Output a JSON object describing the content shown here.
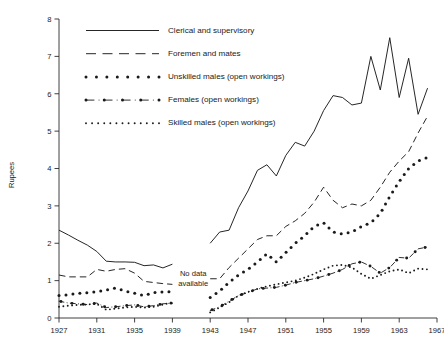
{
  "chart_data": {
    "type": "line",
    "title": "",
    "xlabel": "",
    "ylabel": "Rupees",
    "xlim": [
      1927,
      1967
    ],
    "ylim": [
      0,
      8
    ],
    "xticks": [
      1927,
      1931,
      1935,
      1939,
      1943,
      1947,
      1951,
      1955,
      1959,
      1963,
      1967
    ],
    "yticks": [
      0,
      1,
      2,
      3,
      4,
      5,
      6,
      7,
      8
    ],
    "grid": false,
    "legend_position": "top-center",
    "annotations": [
      {
        "text": "No data available",
        "x": 1941.2,
        "y": 1.12
      }
    ],
    "gap_note": "No data available between 1940 and 1942",
    "series": [
      {
        "name": "Clerical and supervisory",
        "style": "solid",
        "segments": [
          {
            "x": [
              1927,
              1928,
              1929,
              1930,
              1931,
              1932,
              1933,
              1934,
              1935,
              1936,
              1937,
              1938,
              1939
            ],
            "y": [
              2.35,
              2.22,
              2.08,
              1.95,
              1.78,
              1.52,
              1.5,
              1.5,
              1.49,
              1.4,
              1.42,
              1.34,
              1.44
            ]
          },
          {
            "x": [
              1943,
              1944,
              1945,
              1946,
              1947,
              1948,
              1949,
              1950,
              1951,
              1952,
              1953,
              1954,
              1955,
              1956,
              1957,
              1958,
              1959,
              1960,
              1961,
              1962,
              1963,
              1964,
              1965,
              1966
            ],
            "y": [
              2.0,
              2.3,
              2.35,
              2.95,
              3.4,
              3.95,
              4.1,
              3.8,
              4.35,
              4.7,
              4.6,
              5.0,
              5.55,
              5.95,
              5.9,
              5.7,
              5.75,
              7.0,
              6.1,
              7.5,
              5.9,
              6.95,
              5.45,
              6.15
            ]
          }
        ]
      },
      {
        "name": "Foremen and mates",
        "style": "dashed",
        "segments": [
          {
            "x": [
              1927,
              1928,
              1929,
              1930,
              1931,
              1932,
              1933,
              1934,
              1935,
              1936,
              1937,
              1938,
              1939
            ],
            "y": [
              1.15,
              1.1,
              1.1,
              1.1,
              1.3,
              1.25,
              1.3,
              1.32,
              1.2,
              0.98,
              0.95,
              0.92,
              0.9
            ]
          },
          {
            "x": [
              1943,
              1944,
              1945,
              1946,
              1947,
              1948,
              1949,
              1950,
              1951,
              1952,
              1953,
              1954,
              1955,
              1956,
              1957,
              1958,
              1959,
              1960,
              1961,
              1962,
              1963,
              1964,
              1965,
              1966
            ],
            "y": [
              1.05,
              1.05,
              1.35,
              1.6,
              1.85,
              2.1,
              2.2,
              2.2,
              2.45,
              2.6,
              2.8,
              3.1,
              3.5,
              3.15,
              2.95,
              3.05,
              3.0,
              3.15,
              3.5,
              3.9,
              4.2,
              4.45,
              4.95,
              5.4
            ]
          }
        ]
      },
      {
        "name": "Unskilled males (open workings)",
        "style": "dotted-large",
        "segments": [
          {
            "x": [
              1927,
              1928,
              1929,
              1930,
              1931,
              1932,
              1933,
              1934,
              1935,
              1936,
              1937,
              1938,
              1939
            ],
            "y": [
              0.6,
              0.62,
              0.66,
              0.68,
              0.7,
              0.75,
              0.8,
              0.72,
              0.66,
              0.6,
              0.68,
              0.7,
              0.7
            ]
          },
          {
            "x": [
              1943,
              1944,
              1945,
              1946,
              1947,
              1948,
              1949,
              1950,
              1951,
              1952,
              1953,
              1954,
              1955,
              1956,
              1957,
              1958,
              1959,
              1960,
              1961,
              1962,
              1963,
              1964,
              1965,
              1966
            ],
            "y": [
              0.55,
              0.72,
              0.95,
              1.15,
              1.3,
              1.5,
              1.72,
              1.5,
              1.75,
              2.0,
              2.2,
              2.45,
              2.55,
              2.3,
              2.25,
              2.3,
              2.45,
              2.55,
              2.8,
              3.25,
              3.65,
              4.0,
              4.2,
              4.3
            ]
          }
        ]
      },
      {
        "name": "Females (open workings)",
        "style": "dash-dot",
        "segments": [
          {
            "x": [
              1927,
              1928,
              1929,
              1930,
              1931,
              1932,
              1933,
              1934,
              1935,
              1936,
              1937,
              1938,
              1939
            ],
            "y": [
              0.45,
              0.4,
              0.38,
              0.36,
              0.4,
              0.28,
              0.3,
              0.33,
              0.35,
              0.3,
              0.33,
              0.38,
              0.4
            ]
          },
          {
            "x": [
              1943,
              1944,
              1945,
              1946,
              1947,
              1948,
              1949,
              1950,
              1951,
              1952,
              1953,
              1954,
              1955,
              1956,
              1957,
              1958,
              1959,
              1960,
              1961,
              1962,
              1963,
              1964,
              1965,
              1966
            ],
            "y": [
              0.2,
              0.3,
              0.45,
              0.6,
              0.68,
              0.78,
              0.8,
              0.82,
              0.88,
              0.95,
              1.0,
              1.05,
              1.12,
              1.2,
              1.3,
              1.45,
              1.5,
              1.38,
              1.2,
              1.35,
              1.62,
              1.6,
              1.85,
              1.9
            ]
          }
        ]
      },
      {
        "name": "Skilled males (open workings)",
        "style": "dotted-small",
        "segments": [
          {
            "x": [
              1927,
              1928,
              1929,
              1930,
              1931,
              1932,
              1933,
              1934,
              1935,
              1936,
              1937,
              1938,
              1939
            ],
            "y": [
              0.3,
              0.33,
              0.35,
              0.36,
              0.38,
              0.22,
              0.25,
              0.28,
              0.3,
              0.28,
              0.3,
              0.36,
              0.42
            ]
          },
          {
            "x": [
              1943,
              1944,
              1945,
              1946,
              1947,
              1948,
              1949,
              1950,
              1951,
              1952,
              1953,
              1954,
              1955,
              1956,
              1957,
              1958,
              1959,
              1960,
              1961,
              1962,
              1963,
              1964,
              1965,
              1966
            ],
            "y": [
              0.15,
              0.28,
              0.42,
              0.6,
              0.7,
              0.78,
              0.85,
              0.9,
              0.95,
              1.0,
              1.08,
              1.18,
              1.3,
              1.4,
              1.42,
              1.35,
              1.18,
              1.05,
              1.15,
              1.25,
              1.3,
              1.2,
              1.32,
              1.3
            ]
          }
        ]
      }
    ]
  },
  "legend": {
    "entries": [
      {
        "label": "Clerical and supervisory",
        "style": "solid"
      },
      {
        "label": "Foremen and mates",
        "style": "dashed"
      },
      {
        "label": "Unskilled males (open workings)",
        "style": "dotted-large"
      },
      {
        "label": "Females (open workings)",
        "style": "dash-dot"
      },
      {
        "label": "Skilled males (open workings)",
        "style": "dotted-small"
      }
    ]
  },
  "axes": {
    "y_title": "Rupees"
  }
}
